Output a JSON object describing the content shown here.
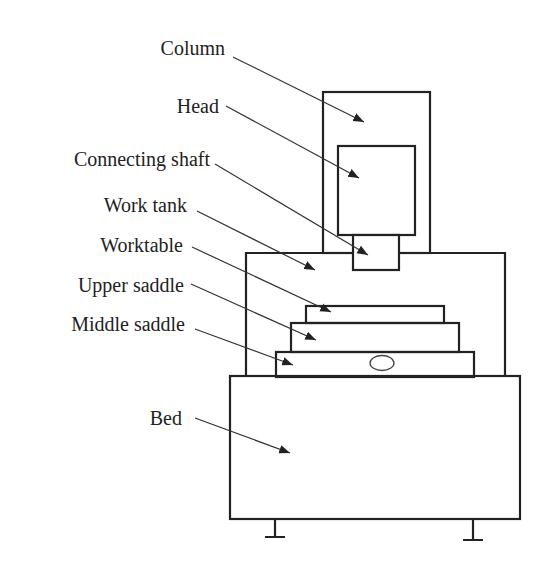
{
  "diagram": {
    "type": "machine-structure",
    "labels": [
      {
        "id": "column",
        "text": "Column"
      },
      {
        "id": "head",
        "text": "Head"
      },
      {
        "id": "connecting-shaft",
        "text": "Connecting shaft"
      },
      {
        "id": "work-tank",
        "text": "Work tank"
      },
      {
        "id": "worktable",
        "text": "Worktable"
      },
      {
        "id": "upper-saddle",
        "text": "Upper saddle"
      },
      {
        "id": "middle-saddle",
        "text": "Middle saddle"
      },
      {
        "id": "bed",
        "text": "Bed"
      }
    ],
    "colors": {
      "stroke": "#222222",
      "background": "#ffffff"
    }
  }
}
